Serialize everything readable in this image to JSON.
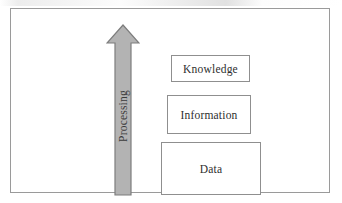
{
  "figure": {
    "type": "diagram",
    "name": "data-information-knowledge-processing-diagram",
    "background_color": "#ffffff",
    "frame_border_color": "#9a9a9a"
  },
  "arrow": {
    "label": "Processing",
    "direction": "up",
    "orientation": "vertical",
    "text_rotation_degrees": -90,
    "fill_color": "#b3b3b3",
    "stroke_color": "#7d7d7d",
    "text_color": "#3b3b3b"
  },
  "boxes": [
    {
      "label": "Knowledge",
      "level": 3,
      "border_color": "#8f8f8f",
      "fill_color": "#ffffff",
      "text_color": "#2e2e2e"
    },
    {
      "label": "Information",
      "level": 2,
      "border_color": "#8f8f8f",
      "fill_color": "#ffffff",
      "text_color": "#2e2e2e"
    },
    {
      "label": "Data",
      "level": 1,
      "border_color": "#8f8f8f",
      "fill_color": "#ffffff",
      "text_color": "#2e2e2e"
    }
  ]
}
